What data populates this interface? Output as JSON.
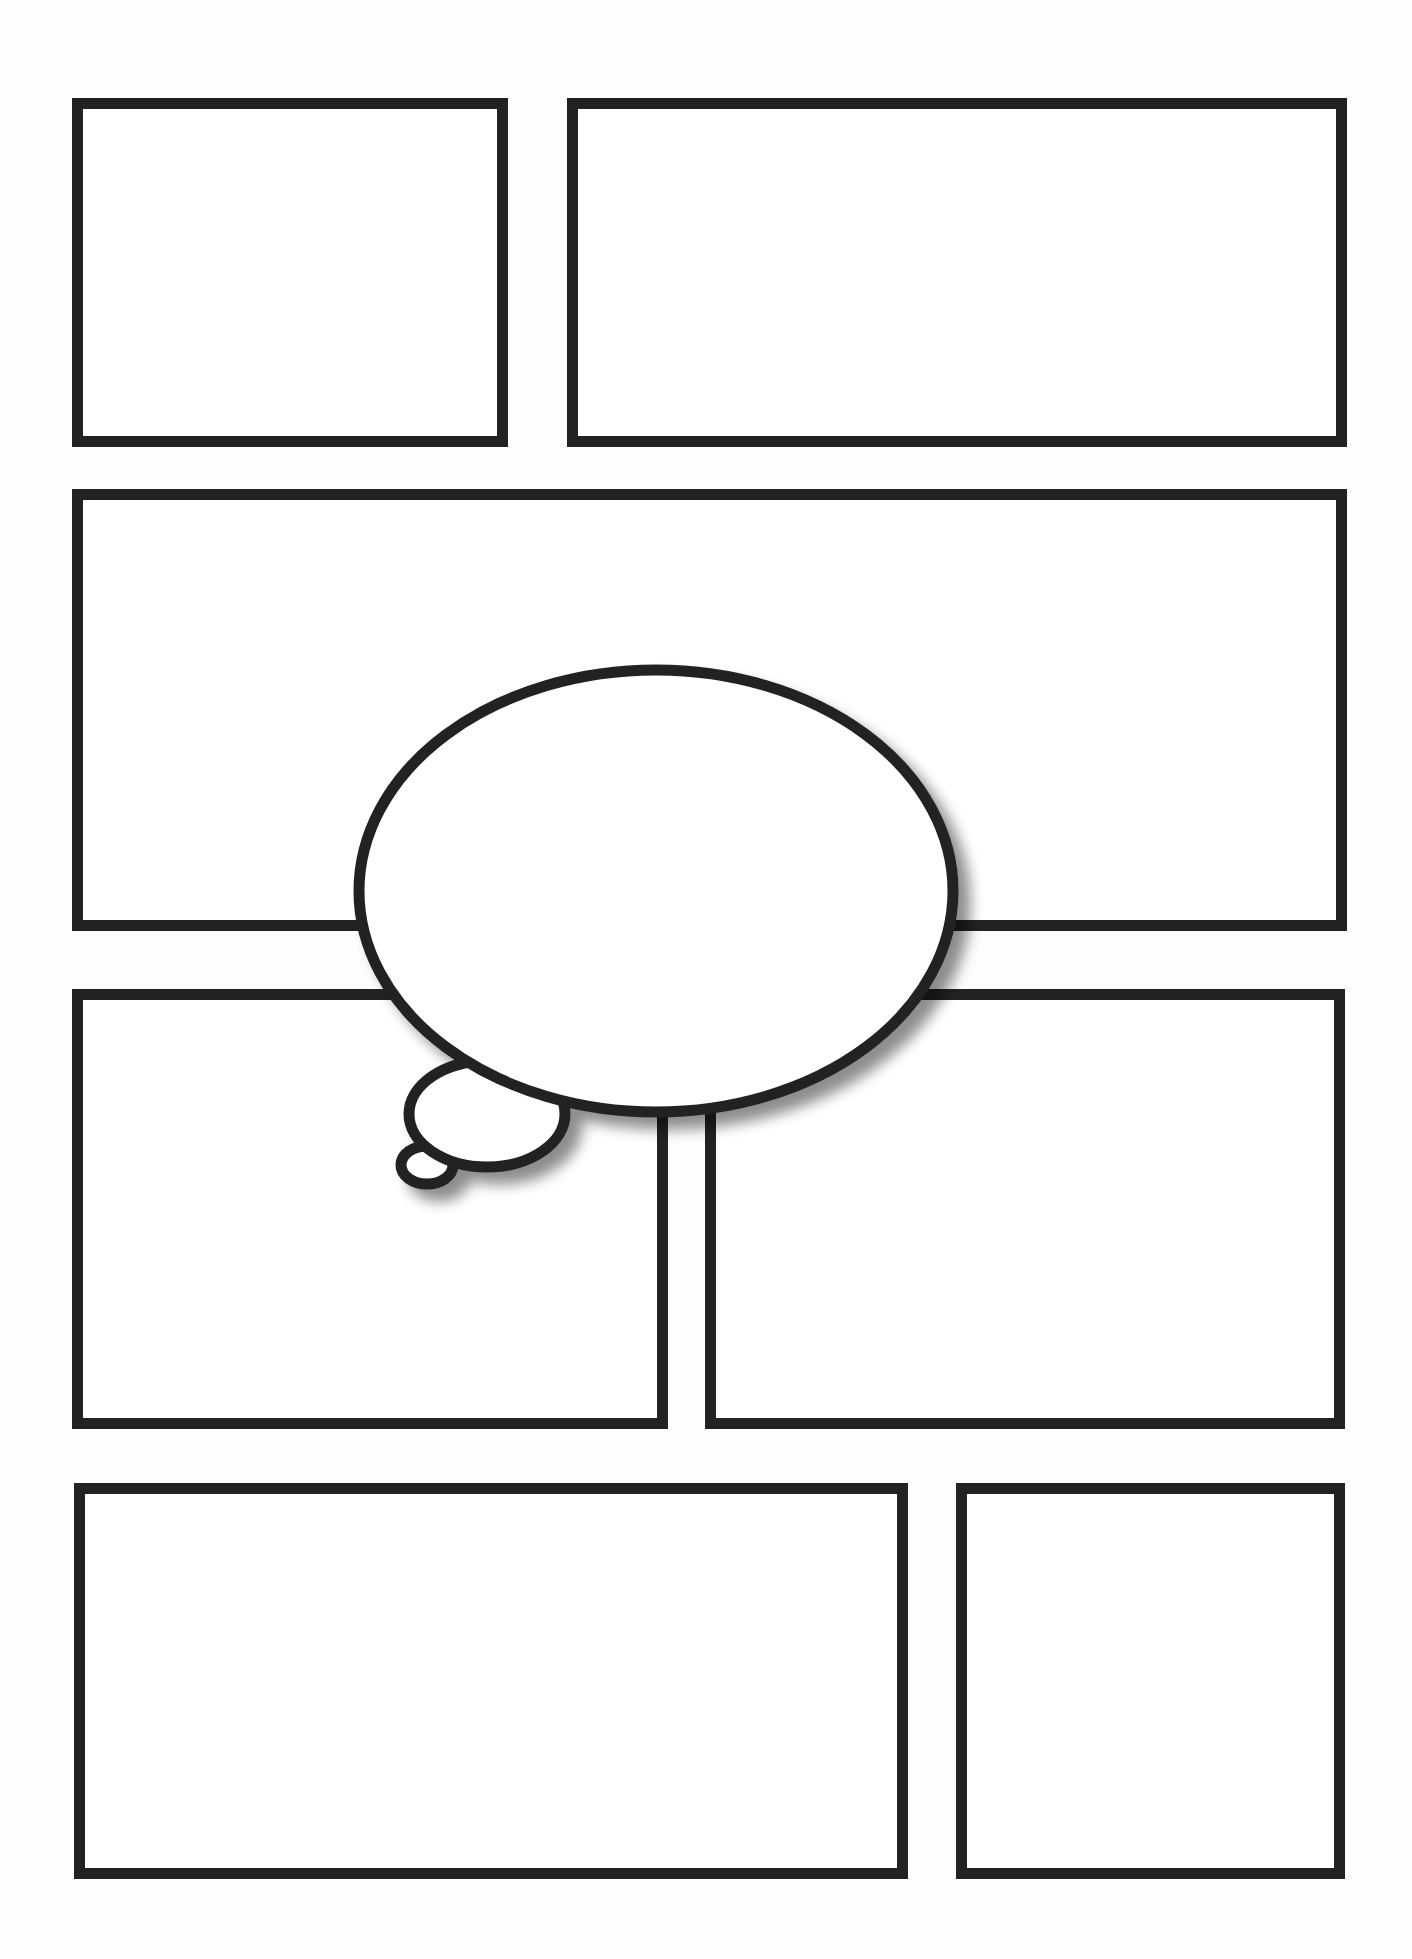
{
  "page": {
    "background": "#fdfdfd",
    "border_color": "#222222",
    "border_width": 11
  },
  "panels": [
    {
      "id": "panel-1",
      "x": 72,
      "y": 98,
      "w": 436,
      "h": 349
    },
    {
      "id": "panel-2",
      "x": 567,
      "y": 98,
      "w": 780,
      "h": 349
    },
    {
      "id": "panel-3",
      "x": 72,
      "y": 489,
      "w": 1275,
      "h": 442
    },
    {
      "id": "panel-4",
      "x": 72,
      "y": 989,
      "w": 596,
      "h": 440
    },
    {
      "id": "panel-5",
      "x": 705,
      "y": 989,
      "w": 640,
      "h": 440
    },
    {
      "id": "panel-6",
      "x": 74,
      "y": 1483,
      "w": 834,
      "h": 396
    },
    {
      "id": "panel-7",
      "x": 956,
      "y": 1483,
      "w": 389,
      "h": 396
    }
  ],
  "thought_bubble": {
    "main": {
      "cx": 656,
      "cy": 891,
      "rx": 297,
      "ry": 221
    },
    "medium": {
      "cx": 487,
      "cy": 1114,
      "rx": 78,
      "ry": 53
    },
    "small": {
      "cx": 427,
      "cy": 1165,
      "rx": 26,
      "ry": 19
    },
    "stroke": "#222222",
    "stroke_width": 11,
    "text": ""
  }
}
